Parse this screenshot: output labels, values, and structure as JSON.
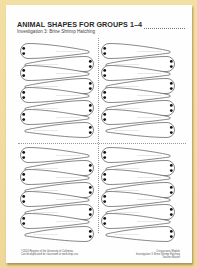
{
  "header": {
    "title": "ANIMAL SHAPES FOR GROUPS 1–4",
    "subtitle": "Investigation 3: Brine Shrimp Hatching"
  },
  "sheet": {
    "layout": "2x2 grid of cut-out sections",
    "sections": [
      {
        "name": "top-left",
        "shape_pairs": 4
      },
      {
        "name": "top-right",
        "shape_pairs": 4
      },
      {
        "name": "bottom-left",
        "shape_pairs": 4
      },
      {
        "name": "bottom-right",
        "shape_pairs": 4
      }
    ],
    "shape_type": "brine-shrimp-outline",
    "colors": {
      "outline": "#555555",
      "eyes": "#111111",
      "background": "#efd79a",
      "paper": "#fefefe"
    }
  },
  "footer": {
    "left_lines": [
      "©2024 Regents of the University of California",
      "Can be duplicated for classroom or workshop use."
    ],
    "right_lines": [
      "Crustaceans Module",
      "Investigation 3: Brine Shrimp Hatching",
      "Teacher Master"
    ]
  }
}
